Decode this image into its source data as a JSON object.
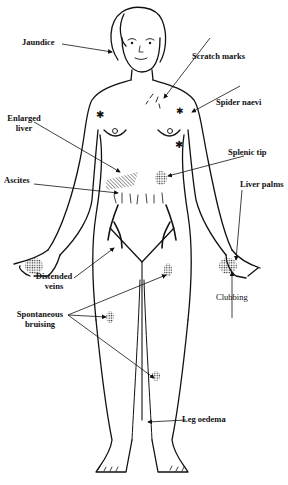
{
  "labels": {
    "jaundice": "Jaundice",
    "scratch_marks": "Scratch marks",
    "spider_naevi": "Spider naevi",
    "enlarged_liver_1": "Enlarged",
    "enlarged_liver_2": "liver",
    "splenic_tip": "Splenic tip",
    "ascites": "Ascites",
    "liver_palms": "Liver palms",
    "distended_veins_1": "Distended",
    "distended_veins_2": "veins",
    "spontaneous_bruising_1": "Spontaneous",
    "spontaneous_bruising_2": "bruising",
    "clubbing": "Clubbing",
    "leg_oedema": "Leg oedema"
  },
  "colors": {
    "ink": "#111111",
    "background": "#ffffff"
  }
}
